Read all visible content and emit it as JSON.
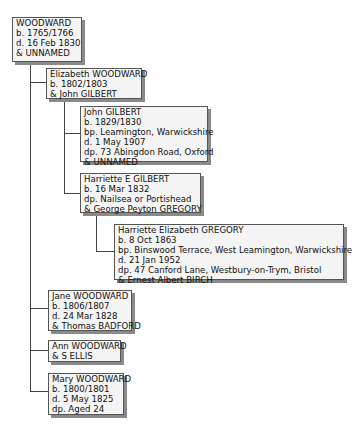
{
  "tree": {
    "root": {
      "lines": [
        "WOODWARD",
        "b. 1765/1766",
        "d. 16 Feb 1830",
        "& UNNAMED"
      ]
    },
    "children": [
      {
        "lines": [
          "Elizabeth WOODWARD",
          "b. 1802/1803",
          "& John GILBERT"
        ],
        "children": [
          {
            "lines": [
              "John GILBERT",
              "b. 1829/1830",
              "bp. Leamington, Warwickshire",
              "d. 1 May 1907",
              "dp. 73 Abingdon Road, Oxford",
              "& UNNAMED"
            ]
          },
          {
            "lines": [
              "Harriette E GILBERT",
              "b. 16 Mar 1832",
              "dp. Nailsea or Portishead",
              "& George Peyton GREGORY"
            ],
            "children": [
              {
                "lines": [
                  "Harriette Elizabeth GREGORY",
                  "b. 8 Oct 1863",
                  "bp. Binswood Terrace, West Leamington, Warwickshire",
                  "d. 21 Jan 1952",
                  "dp. 47 Canford Lane, Westbury-on-Trym, Bristol",
                  "& Ernest Albert BIRCH"
                ]
              }
            ]
          }
        ]
      },
      {
        "lines": [
          "Jane WOODWARD",
          "b. 1806/1807",
          "d. 24 Mar 1828",
          "& Thomas BADFORD"
        ]
      },
      {
        "lines": [
          "Ann WOODWARD",
          "& S ELLIS"
        ]
      },
      {
        "lines": [
          "Mary WOODWARD",
          "b. 1800/1801",
          "d. 5 May 1825",
          "dp. Aged 24"
        ]
      }
    ]
  },
  "colors": {
    "box_background": "#f4f4f4",
    "box_border": "#555555",
    "box_shadow": "#8a8a8a",
    "connector": "#444444"
  }
}
